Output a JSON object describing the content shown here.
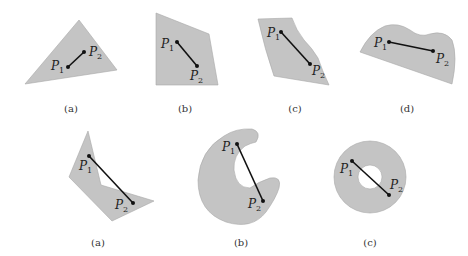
{
  "rows": [
    {
      "name": "convex-sets",
      "figures": [
        {
          "caption": "(a)",
          "p1": "P",
          "p1_sub": "1",
          "p2": "P",
          "p2_sub": "2",
          "shape": "triangle"
        },
        {
          "caption": "(b)",
          "p1": "P",
          "p1_sub": "1",
          "p2": "P",
          "p2_sub": "2",
          "shape": "quadrilateral"
        },
        {
          "caption": "(c)",
          "p1": "P",
          "p1_sub": "1",
          "p2": "P",
          "p2_sub": "2",
          "shape": "curved-quadrilateral"
        },
        {
          "caption": "(d)",
          "p1": "P",
          "p1_sub": "1",
          "p2": "P",
          "p2_sub": "2",
          "shape": "wavy-blob"
        }
      ]
    },
    {
      "name": "non-convex-sets",
      "figures": [
        {
          "caption": "(a)",
          "p1": "P",
          "p1_sub": "1",
          "p2": "P",
          "p2_sub": "2",
          "shape": "chevron-polygon"
        },
        {
          "caption": "(b)",
          "p1": "P",
          "p1_sub": "1",
          "p2": "P",
          "p2_sub": "2",
          "shape": "crescent"
        },
        {
          "caption": "(c)",
          "p1": "P",
          "p1_sub": "1",
          "p2": "P",
          "p2_sub": "2",
          "shape": "annulus"
        }
      ]
    }
  ],
  "colors": {
    "fill": "#c4c4c4",
    "segment": "#111111",
    "background": "#ffffff"
  }
}
